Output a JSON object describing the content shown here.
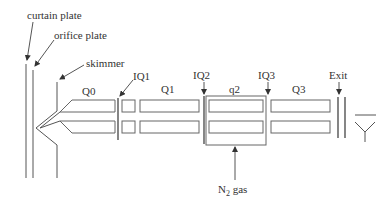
{
  "figure": {
    "type": "triple quadrupole mass spectrometer schematic",
    "labels": {
      "curtain_plate": "curtain plate",
      "orifice_plate": "orifice plate",
      "skimmer": "skimmer",
      "q0": "Q0",
      "iq1": "IQ1",
      "q1": "Q1",
      "iq2": "IQ2",
      "q2": "q2",
      "iq3": "IQ3",
      "q3": "Q3",
      "exit": "Exit",
      "gas_prefix": "N",
      "gas_subscript": "2",
      "gas_suffix": " gas"
    },
    "colors": {
      "line": "#555555",
      "text": "#333333",
      "background": "#ffffff"
    }
  }
}
